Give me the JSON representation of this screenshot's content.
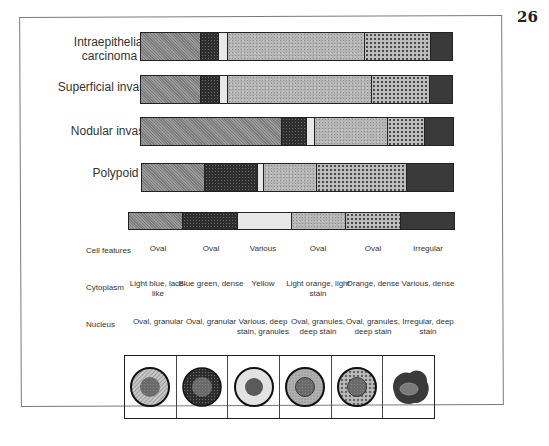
{
  "page_number": "26",
  "stages": [
    {
      "label": "Intraepithelial carcinoma",
      "segments": [
        {
          "type": "granular-grey",
          "fraction": 0.19
        },
        {
          "type": "dark-stipple",
          "fraction": 0.058
        },
        {
          "type": "white",
          "fraction": 0.029
        },
        {
          "type": "light-grey",
          "fraction": 0.44
        },
        {
          "type": "dotted",
          "fraction": 0.212
        },
        {
          "type": "black",
          "fraction": 0.071
        }
      ]
    },
    {
      "label": "Superficial invasion",
      "segments": [
        {
          "type": "granular-grey",
          "fraction": 0.19
        },
        {
          "type": "dark-stipple",
          "fraction": 0.06
        },
        {
          "type": "white",
          "fraction": 0.025
        },
        {
          "type": "light-grey",
          "fraction": 0.465
        },
        {
          "type": "dotted",
          "fraction": 0.185
        },
        {
          "type": "black",
          "fraction": 0.075
        }
      ]
    },
    {
      "label": "Nodular invasion",
      "segments": [
        {
          "type": "granular-grey",
          "fraction": 0.45
        },
        {
          "type": "dark-stipple",
          "fraction": 0.08
        },
        {
          "type": "white",
          "fraction": 0.025
        },
        {
          "type": "light-grey",
          "fraction": 0.233
        },
        {
          "type": "dotted",
          "fraction": 0.118
        },
        {
          "type": "black",
          "fraction": 0.094
        }
      ]
    },
    {
      "label": "Polypoid",
      "segments": [
        {
          "type": "granular-grey",
          "fraction": 0.198
        },
        {
          "type": "dark-stipple",
          "fraction": 0.172
        },
        {
          "type": "white",
          "fraction": 0.019
        },
        {
          "type": "light-grey",
          "fraction": 0.172
        },
        {
          "type": "dotted",
          "fraction": 0.287
        },
        {
          "type": "black",
          "fraction": 0.152
        }
      ]
    }
  ],
  "legend_segments": [
    "granular-grey",
    "dark-stipple",
    "white",
    "light-grey",
    "dotted",
    "black"
  ],
  "table": {
    "row_labels": [
      "Cell features",
      "Cytoplasm",
      "Nucleus"
    ],
    "columns": [
      {
        "cell_features": "Oval",
        "cytoplasm": "Light blue, lace-like",
        "nucleus": "Oval, granular",
        "icon": "cell-light-hatched-icon"
      },
      {
        "cell_features": "Oval",
        "cytoplasm": "Blue green, dense",
        "nucleus": "Oval, granular",
        "icon": "cell-dark-stippled-icon"
      },
      {
        "cell_features": "Various",
        "cytoplasm": "Yellow",
        "nucleus": "Various, deep stain, granules",
        "icon": "cell-white-icon"
      },
      {
        "cell_features": "Oval",
        "cytoplasm": "Light orange, light stain",
        "nucleus": "Oval, granules, deep stain",
        "icon": "cell-light-grey-icon"
      },
      {
        "cell_features": "Oval",
        "cytoplasm": "Orange, dense",
        "nucleus": "Oval, granules, deep stain",
        "icon": "cell-dotted-icon"
      },
      {
        "cell_features": "Irregular",
        "cytoplasm": "Various, dense",
        "nucleus": "Irregular, deep stain",
        "icon": "cell-irregular-dark-icon"
      }
    ]
  }
}
